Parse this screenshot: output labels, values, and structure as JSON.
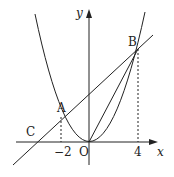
{
  "diagram": {
    "type": "coordinate-geometry",
    "axes": {
      "x_label": "x",
      "y_label": "y",
      "origin_label": "O"
    },
    "points": {
      "A": {
        "label": "A",
        "x": -2,
        "y": 2
      },
      "B": {
        "label": "B",
        "x": 4,
        "y": 8
      },
      "C": {
        "label": "C",
        "x": -4,
        "y": 0
      },
      "O": {
        "label": "O",
        "x": 0,
        "y": 0
      }
    },
    "tick_labels": {
      "neg2": "−2",
      "four": "4"
    },
    "colors": {
      "stroke": "#222222",
      "background": "#ffffff"
    }
  }
}
